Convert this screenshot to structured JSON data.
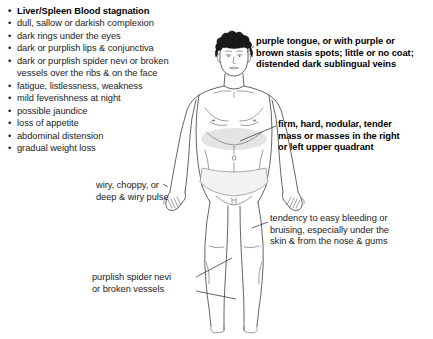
{
  "document": {
    "title": "Liver/Spleen Blood stagnation",
    "type": "clinical-sign-diagram",
    "background_color": "#ffffff",
    "text_color": "#1c1c1c",
    "accent_shade_color": "#d9d9d9"
  },
  "symptom_list": {
    "heading": "Liver/Spleen Blood stagnation",
    "items": [
      {
        "text": "dull, sallow or darkish complexion"
      },
      {
        "text": "dark rings under the eyes"
      },
      {
        "text": "dark or purplish lips & conjunctiva"
      },
      {
        "text": "dark or purplish spider nevi or broken",
        "continuation": "vessels over the ribs & on the face"
      },
      {
        "text": "fatigue, listlessness, weakness"
      },
      {
        "text": "mild feverishness at night"
      },
      {
        "text": "possible jaundice"
      },
      {
        "text": "loss of appetite"
      },
      {
        "text": "abdominal distension"
      },
      {
        "text": "gradual weight loss"
      }
    ],
    "bullet_glyph": "•"
  },
  "annotations": {
    "tongue": {
      "text": "purple tongue, or with purple or\nbrown stasis spots; little or no coat;\ndistended dark sublingual veins",
      "emphasis": "bold",
      "target": "tongue-and-face"
    },
    "mass": {
      "text": "firm, hard, nodular, tender\nmass or masses in the right\nor left upper quadrant",
      "emphasis": "bold",
      "target": "upper-abdomen"
    },
    "bleeding": {
      "text": "tendency to easy bleeding or\nbruising, especially under the\nskin & from the nose & gums",
      "emphasis": "regular",
      "target": "lower-body"
    },
    "pulse": {
      "text": "wiry, choppy, or\ndeep & wiry pulse",
      "emphasis": "regular",
      "target": "right-hand-wrist"
    },
    "nevi": {
      "text": "purplish spider nevi\nor broken vessels",
      "emphasis": "regular",
      "target": "legs-and-thighs"
    }
  },
  "figure": {
    "shaded_region_label": "upper abdominal mass shading"
  },
  "footer_note": ""
}
